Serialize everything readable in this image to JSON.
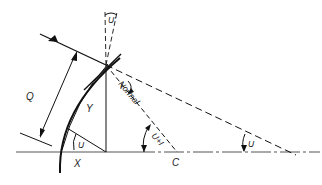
{
  "diagram": {
    "type": "optical-refraction-geometry",
    "labels": {
      "q": "Q",
      "y": "Y",
      "x": "X",
      "c": "C",
      "normal": "Normal",
      "u_vertex": "U",
      "u_prime_top": "U'",
      "i_angle": "I",
      "u_plus_i": "U+I",
      "u_far": "U"
    },
    "colors": {
      "line": "#111111",
      "axis": "#555555",
      "text": "#222222",
      "background": "#ffffff"
    }
  }
}
